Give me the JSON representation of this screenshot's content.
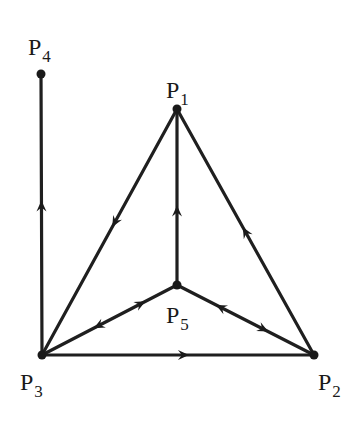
{
  "diagram": {
    "type": "directed-graph",
    "colors": {
      "stroke": "#1f1f1f",
      "background": "#ffffff"
    },
    "nodes": [
      {
        "id": "P1",
        "label": "P",
        "sub": "1",
        "x": 177,
        "y": 109,
        "label_x": 166,
        "label_y": 98
      },
      {
        "id": "P2",
        "label": "P",
        "sub": "2",
        "x": 314,
        "y": 355,
        "label_x": 318,
        "label_y": 390
      },
      {
        "id": "P3",
        "label": "P",
        "sub": "3",
        "x": 42,
        "y": 355,
        "label_x": 20,
        "label_y": 390
      },
      {
        "id": "P4",
        "label": "P",
        "sub": "4",
        "x": 41,
        "y": 74,
        "label_x": 28,
        "label_y": 55
      },
      {
        "id": "P5",
        "label": "P",
        "sub": "5",
        "x": 177,
        "y": 285,
        "label_x": 166,
        "label_y": 323
      }
    ],
    "edges": [
      {
        "from": "P3",
        "to": "P4",
        "arrows": [
          {
            "at": 0.53,
            "dir": "forward"
          }
        ]
      },
      {
        "from": "P1",
        "to": "P3",
        "arrows": [
          {
            "at": 0.46,
            "dir": "forward"
          }
        ]
      },
      {
        "from": "P2",
        "to": "P1",
        "arrows": [
          {
            "at": 0.5,
            "dir": "forward"
          }
        ]
      },
      {
        "from": "P5",
        "to": "P1",
        "arrows": [
          {
            "at": 0.42,
            "dir": "forward"
          }
        ]
      },
      {
        "from": "P3",
        "to": "P2",
        "arrows": [
          {
            "at": 0.52,
            "dir": "forward"
          }
        ]
      },
      {
        "from": "P5",
        "to": "P3",
        "arrows": [
          {
            "at": 0.58,
            "dir": "forward"
          },
          {
            "at": 0.27,
            "dir": "backward"
          }
        ]
      },
      {
        "from": "P5",
        "to": "P2",
        "arrows": [
          {
            "at": 0.32,
            "dir": "backward"
          },
          {
            "at": 0.63,
            "dir": "forward"
          }
        ]
      }
    ]
  }
}
